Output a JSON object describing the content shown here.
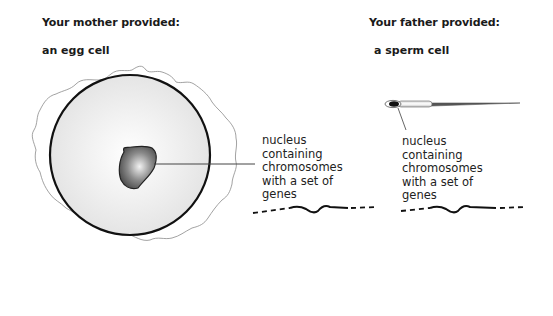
{
  "mother": {
    "heading": "Your mother provided:",
    "cell_name": "an egg cell",
    "label_lines": [
      "nucleus",
      "containing",
      "chromosomes",
      "with a set of",
      "genes"
    ]
  },
  "father": {
    "heading": "Your father provided:",
    "cell_name": "a sperm cell",
    "label_lines": [
      "nucleus",
      "containing",
      "chromosomes",
      "with a set of",
      "genes"
    ]
  }
}
